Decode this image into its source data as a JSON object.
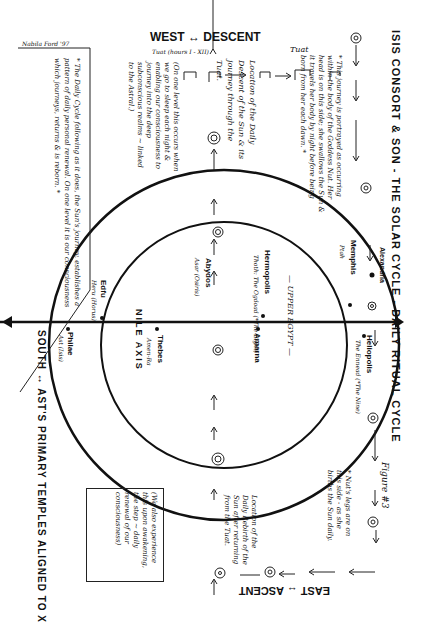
{
  "title": "ISIS CONSORT & SON - THE SOLAR CYCLE - DAILY RITUAL CYCLE",
  "figure_label": "Figure #3",
  "signature": "Nabila Ford '97",
  "compass": {
    "north": "NORTH ↑ UPPER",
    "west": "WEST ↔ DESCENT",
    "east": "EAST ↔ ASCENT",
    "south": "SOUTH ↔ AST'S PRIMARY TEMPLES ALIGNED TO X"
  },
  "tuat_label": "Tuat (hours I - XII)",
  "tuat_mid": "Tuat",
  "axis_label": "NILE AXIS",
  "upper_egypt": "— UPPER EGYPT —",
  "places": [
    {
      "name": "Alexandria",
      "sub": ""
    },
    {
      "name": "Memphis",
      "sub": "Ptah"
    },
    {
      "name": "Heliopolis",
      "sub": "The Ennead (*The Nine)"
    },
    {
      "name": "Hermopolis",
      "sub": "Thoth: The Ogdoad (*The Eight)"
    },
    {
      "name": "Amarna",
      "sub": ""
    },
    {
      "name": "Abydos",
      "sub": "Asar (Osiris)"
    },
    {
      "name": "Thebes",
      "sub": "Amen-Ra"
    },
    {
      "name": "Edfu",
      "sub": "Heru (Horus)"
    },
    {
      "name": "Philae",
      "sub": "Ast (Isis)"
    }
  ],
  "notes": {
    "nut": "* This journey is portrayed as occurring within the body of the Goddess Nut. Her head is on this side; she swallows the Sun & it travels her body by night before being born from her each dawn. *",
    "descent": "Location of the Daily Descent of the Sun & its journey through the Tuat.",
    "one_level": "(On one level this occurs when we go to sleep each night & enabling our consciousness to journey into the deep subconscious realms ~ linked to the Astral.)",
    "daily_cycle": "* The Daily Cycle following as it does, the Sun's journey, establishes a pattern of daily personal renewal. On one level it is our consciousness which journeys, returns & is reborn. *",
    "rebirth": "Location of the Daily Rebirth of the Sun after returning from the Tuat.",
    "nut_birth": "* Nut's legs are on this side - as she births the Sun daily.",
    "awakening": "(We also experience this upon awakening, the step ~ daily renewal of our consciousness)"
  }
}
